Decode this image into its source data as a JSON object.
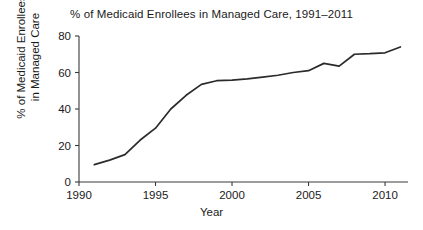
{
  "chart_data": {
    "type": "line",
    "title": "% of Medicaid Enrollees in Managed Care, 1991–2011",
    "xlabel": "Year",
    "ylabel": "% of Medicaid Enrollees in Managed Care",
    "ylabel_line1": "% of Medicaid Enrollees",
    "ylabel_line2": "in Managed Care",
    "grid": false,
    "legend": "none",
    "xlim": [
      1990,
      2011.5
    ],
    "ylim": [
      0,
      82
    ],
    "xticks": [
      1990,
      1995,
      2000,
      2005,
      2010
    ],
    "xticklabels": [
      "1990",
      "1995",
      "2000",
      "2005",
      "2010"
    ],
    "yticks": [
      0,
      20,
      40,
      60,
      80
    ],
    "yticklabels": [
      "0",
      "20",
      "40",
      "60",
      "80"
    ],
    "series": [
      {
        "name": "% of Medicaid enrollees in managed care",
        "color": "#2b2b2b",
        "x": [
          1991,
          1992,
          1993,
          1994,
          1995,
          1996,
          1997,
          1998,
          1999,
          2000,
          2001,
          2002,
          2003,
          2004,
          2005,
          2006,
          2007,
          2008,
          2009,
          2010,
          2011
        ],
        "values": [
          9.5,
          12.0,
          15.0,
          23.0,
          29.5,
          40.0,
          47.5,
          53.5,
          55.5,
          55.8,
          56.5,
          57.5,
          58.5,
          60.0,
          61.0,
          65.0,
          63.5,
          70.0,
          70.3,
          70.8,
          74.0
        ]
      }
    ]
  },
  "figure": {
    "background": "#ffffff",
    "axis_color": "#3a3a3a",
    "text_color": "#1a1a1a"
  }
}
